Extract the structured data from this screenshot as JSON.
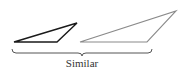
{
  "diagram": {
    "caption": "Similar",
    "colors": {
      "small_triangle": "#1a1a1a",
      "large_triangle": "#8a8a8a",
      "brace": "#555555",
      "text": "#333333"
    },
    "shapes": [
      {
        "id": "small-triangle",
        "points": [
          [
            14,
            42
          ],
          [
            57,
            42
          ],
          [
            77,
            23
          ]
        ]
      },
      {
        "id": "large-triangle",
        "points": [
          [
            80,
            42
          ],
          [
            147,
            42
          ],
          [
            176,
            11
          ]
        ]
      }
    ],
    "brace": {
      "x_start": 12,
      "x_end": 152,
      "center_x": 82,
      "y": 52
    }
  }
}
